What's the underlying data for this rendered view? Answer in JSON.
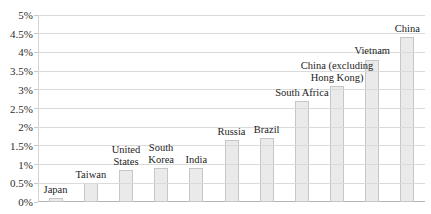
{
  "chart_data": {
    "type": "bar",
    "title": "",
    "categories": [
      "Japan",
      "Taiwan",
      "United States",
      "South Korea",
      "India",
      "Russia",
      "Brazil",
      "South Africa",
      "China (excluding Hong Kong)",
      "Vietnam",
      "China"
    ],
    "label_lines": [
      [
        "Japan"
      ],
      [
        "Taiwan"
      ],
      [
        "United",
        "States"
      ],
      [
        "South",
        "Korea"
      ],
      [
        "India"
      ],
      [
        "Russia"
      ],
      [
        "Brazil"
      ],
      [
        "South Africa"
      ],
      [
        "China (excluding",
        "Hong Kong)"
      ],
      [
        "Vietnam"
      ],
      [
        "China"
      ]
    ],
    "values": [
      0.1,
      0.5,
      0.85,
      0.9,
      0.9,
      1.65,
      1.7,
      2.7,
      3.1,
      3.8,
      4.4
    ],
    "unit": "%",
    "ylim": [
      0,
      5
    ],
    "ytick_step": 0.5,
    "ytick_labels": [
      "0%",
      "0.5%",
      "1%",
      "1.5%",
      "2%",
      "2.5%",
      "3%",
      "3.5%",
      "4%",
      "4.5%",
      "5%"
    ],
    "xlabel": "",
    "ylabel": "",
    "grid": "horizontal",
    "legend_position": "none",
    "colors": {
      "bar_fill": "#eaeaea",
      "bar_border": "#c6c6c6",
      "gridline": "#dadada",
      "axis_line": "#b3b3b3",
      "y_axis_line": "#d4d4d4",
      "text": "#232323",
      "background": "#ffffff"
    }
  }
}
